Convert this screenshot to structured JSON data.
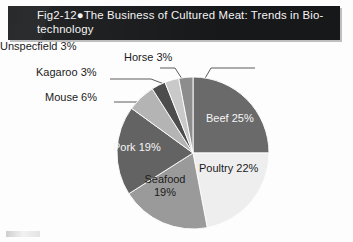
{
  "figure": {
    "title": "Fig2-12●The Business of Cultured Meat: Trends in Bio-\ntechnology",
    "title_label": "Fig2-12",
    "bullet": "●",
    "background_color": "#fdfdfd",
    "title_bar_color": "#17181a",
    "title_text_color": "#f4f4f4"
  },
  "chart_data": {
    "type": "pie",
    "xlabel": "",
    "ylabel": "",
    "grid": false,
    "legend_position": "none",
    "start_angle_deg": 0,
    "direction": "clockwise",
    "units": "%",
    "total": 100,
    "categories": [
      "Beef",
      "Poultry",
      "Seafood",
      "Pork",
      "Mouse",
      "Kagaroo",
      "Horse",
      "Unspecfield"
    ],
    "values": [
      25,
      22,
      19,
      19,
      6,
      3,
      3,
      3
    ],
    "colors": [
      "#6a6a6a",
      "#eeeeee",
      "#9a9a9a",
      "#636363",
      "#b4b4b4",
      "#4d4d4d",
      "#c9c9c9",
      "#8d8d8d"
    ],
    "label_placement": [
      "inside",
      "inside",
      "inside",
      "inside",
      "outside",
      "outside",
      "outside",
      "outside"
    ],
    "slices": [
      {
        "name": "Beef",
        "value": 25,
        "label": "Beef 25%",
        "color": "#6a6a6a",
        "text_color": "#f6f6f6",
        "placement": "inside"
      },
      {
        "name": "Poultry",
        "value": 22,
        "label": "Poultry 22%",
        "color": "#eeeeee",
        "text_color": "#1b1b1b",
        "placement": "inside"
      },
      {
        "name": "Seafood",
        "value": 19,
        "label": "Seafood 19%",
        "color": "#9a9a9a",
        "text_color": "#1b1b1b",
        "placement": "inside"
      },
      {
        "name": "Pork",
        "value": 19,
        "label": "Pork 19%",
        "color": "#636363",
        "text_color": "#f6f6f6",
        "placement": "inside"
      },
      {
        "name": "Mouse",
        "value": 6,
        "label": "Mouse 6%",
        "color": "#b4b4b4",
        "text_color": "#1b1b1b",
        "placement": "outside"
      },
      {
        "name": "Kagaroo",
        "value": 3,
        "label": "Kagaroo 3%",
        "color": "#4d4d4d",
        "text_color": "#1b1b1b",
        "placement": "outside"
      },
      {
        "name": "Horse",
        "value": 3,
        "label": "Horse 3%",
        "color": "#c9c9c9",
        "text_color": "#1b1b1b",
        "placement": "outside"
      },
      {
        "name": "Unspecfield",
        "value": 3,
        "label": "Unspecfield 3%",
        "color": "#8d8d8d",
        "text_color": "#1b1b1b",
        "placement": "outside"
      }
    ]
  }
}
